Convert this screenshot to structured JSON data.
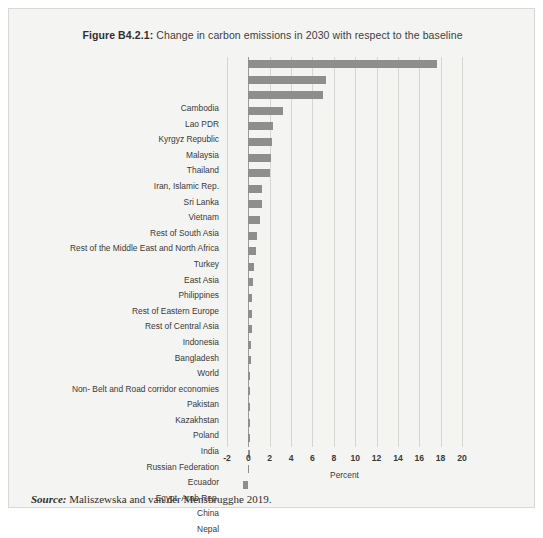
{
  "figure": {
    "label": "Figure B4.2.1:",
    "title": " Change in carbon emissions in 2030 with respect to the baseline",
    "source_label": "Source:",
    "source_text": " Maliszewska and van der Mensbrugghe 2019.",
    "bar_color": "#8e8e8e",
    "grid_color": "#d5d5d2",
    "panel_color": "#f4f4f2"
  },
  "chart_data": {
    "type": "bar",
    "orientation": "horizontal",
    "title": "Figure B4.2.1: Change in carbon emissions in 2030 with respect to the baseline",
    "xlabel": "Percent",
    "ylabel": "",
    "xlim": [
      -2,
      20
    ],
    "xticks": [
      -2,
      0,
      2,
      4,
      6,
      8,
      10,
      12,
      14,
      16,
      18,
      20
    ],
    "xtick_labels": [
      "-2",
      "0",
      "2",
      "4",
      "6",
      "8",
      "10",
      "12",
      "14",
      "16",
      "18",
      "20"
    ],
    "grid": true,
    "legend": false,
    "categories": [
      "Cambodia",
      "Lao PDR",
      "Kyrgyz Republic",
      "Malaysia",
      "Thailand",
      "Iran, Islamic Rep.",
      "Sri Lanka",
      "Vietnam",
      "Rest of South Asia",
      "Rest of the Middle East and North Africa",
      "Turkey",
      "East Asia",
      "Philippines",
      "Rest of Eastern Europe",
      "Rest of Central Asia",
      "Indonesia",
      "Bangladesh",
      "World",
      "Non- Belt and Road corridor economies",
      "Pakistan",
      "Kazakhstan",
      "Poland",
      "India",
      "Russian Federation",
      "Ecuador",
      "Egypt, Arab Rep.",
      "China",
      "Nepal"
    ],
    "values": [
      17.7,
      7.3,
      7.0,
      3.2,
      2.3,
      2.2,
      2.1,
      2.0,
      1.3,
      1.3,
      1.1,
      0.8,
      0.7,
      0.5,
      0.4,
      0.35,
      0.3,
      0.3,
      0.28,
      0.25,
      0.2,
      0.18,
      0.15,
      0.15,
      0.12,
      0.12,
      0.1,
      -0.5
    ],
    "values_unit": "percent"
  }
}
